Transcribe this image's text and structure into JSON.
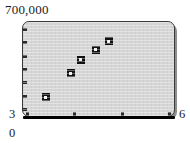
{
  "chart_data": {
    "type": "scatter",
    "title": "",
    "subtitle": "",
    "xlabel": "",
    "ylabel": "",
    "ylim": [
      0,
      700000
    ],
    "xlim": [
      3,
      6
    ],
    "grid": false,
    "legend": null,
    "y_axis_max_label": "700,000",
    "y_axis_min_label": "3",
    "x_axis_max_label": "6",
    "origin_label": "0",
    "y_tick_count": 7,
    "x_tick_count": 4,
    "marker_style": "filled-square-with-light-center",
    "marker_color": "#111111",
    "panel_color": "#d6d6d6",
    "axis_color": "#2b2b2b",
    "points": [
      {
        "x": 3.45,
        "y": 140000
      },
      {
        "x": 3.95,
        "y": 320000
      },
      {
        "x": 4.15,
        "y": 420000
      },
      {
        "x": 4.45,
        "y": 495000
      },
      {
        "x": 4.7,
        "y": 555000
      }
    ],
    "x_values": [
      3.45,
      3.95,
      4.15,
      4.45,
      4.7
    ],
    "y_values": [
      140000,
      320000,
      420000,
      495000,
      555000
    ]
  },
  "labels": {
    "y_max": "700,000",
    "y_min": "3",
    "x_max": "6",
    "origin": "0"
  }
}
